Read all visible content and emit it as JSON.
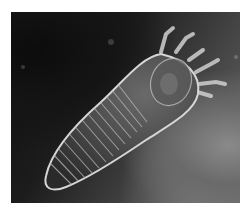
{
  "image": {
    "subject": "mite (Demodex) micrograph",
    "style": "grayscale scanning electron micrograph",
    "colors": {
      "background": "#ffffff",
      "dark_area": "#111111",
      "light_area": "#7a7a7a",
      "specimen_outline": "#d8d8d8"
    }
  }
}
